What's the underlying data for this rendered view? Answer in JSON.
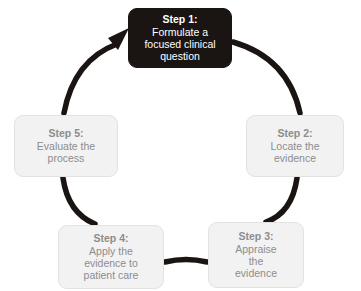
{
  "diagram": {
    "type": "cycle",
    "direction": "clockwise",
    "ring_color": "#1a1512",
    "highlight_color": "#1a1512",
    "box_color": "#f2f2f2",
    "box_text_color": "#8d8d8d",
    "highlight_text_color": "#ffffff",
    "background": "#ffffff",
    "arrow_target": "step-1",
    "steps": [
      {
        "id": "step-1",
        "title": "Step 1:",
        "lines": [
          "Formulate a",
          "focused clinical",
          "question"
        ],
        "highlighted": true
      },
      {
        "id": "step-2",
        "title": "Step 2:",
        "lines": [
          "Locate the",
          "evidence"
        ],
        "highlighted": false
      },
      {
        "id": "step-3",
        "title": "Step 3:",
        "lines": [
          "Appraise",
          "the",
          "evidence"
        ],
        "highlighted": false
      },
      {
        "id": "step-4",
        "title": "Step 4:",
        "lines": [
          "Apply the",
          "evidence to",
          "patient care"
        ],
        "highlighted": false
      },
      {
        "id": "step-5",
        "title": "Step 5:",
        "lines": [
          "Evaluate the",
          "process"
        ],
        "highlighted": false
      }
    ]
  }
}
